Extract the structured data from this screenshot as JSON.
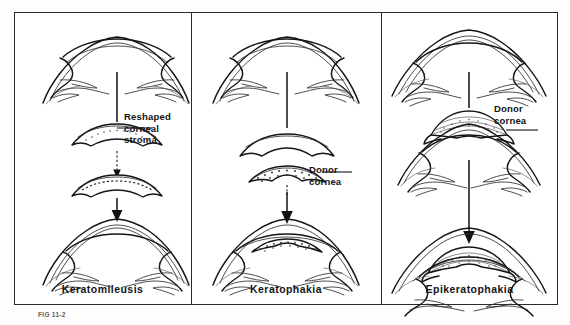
{
  "figure": {
    "caption_number": "FIG 11-2",
    "frame": {
      "border_color": "#2b2b2f",
      "background": "#ffffff"
    },
    "ink_color": "#151518"
  },
  "panels": [
    {
      "id": "keratomileusis",
      "label": "Keratomileusis",
      "callouts": [
        {
          "id": "reshaped-corneal-stroma",
          "lines": [
            "Reshaped",
            "corneal",
            "stroma"
          ]
        }
      ],
      "stages": [
        {
          "id": "donor-eye-top",
          "kind": "eye-cross-section-flap-lifted"
        },
        {
          "id": "lenticule-removed",
          "kind": "corneal-lenticule"
        },
        {
          "id": "lenticule-reshaped",
          "kind": "corneal-lenticule-reshaped"
        },
        {
          "id": "recipient-eye-bottom",
          "kind": "eye-cross-section-sutured"
        }
      ]
    },
    {
      "id": "keratophakia",
      "label": "Keratophakia",
      "callouts": [
        {
          "id": "donor-cornea",
          "lines": [
            "Donor",
            "cornea"
          ]
        }
      ],
      "stages": [
        {
          "id": "patient-eye-top",
          "kind": "eye-cross-section-flap-lifted"
        },
        {
          "id": "corneal-cap",
          "kind": "corneal-cap-plain"
        },
        {
          "id": "donor-lenticule",
          "kind": "donor-lenticule-stippled"
        },
        {
          "id": "result-eye-bottom",
          "kind": "eye-cross-section-implanted"
        }
      ]
    },
    {
      "id": "epikeratophakia",
      "label": "Epikeratophakia",
      "callouts": [
        {
          "id": "donor-cornea",
          "lines": [
            "Donor",
            "cornea"
          ]
        }
      ],
      "stages": [
        {
          "id": "patient-eye-top",
          "kind": "eye-cross-section-intact"
        },
        {
          "id": "donor-tissue-lens",
          "kind": "donor-onlay-stippled"
        },
        {
          "id": "host-bed-eye",
          "kind": "eye-cross-section-deepithelialized"
        },
        {
          "id": "result-eye-bottom",
          "kind": "eye-cross-section-onlay-sutured"
        }
      ]
    }
  ]
}
